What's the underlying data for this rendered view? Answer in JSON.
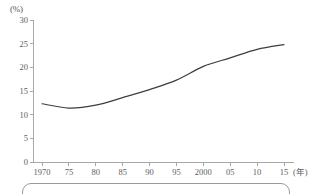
{
  "figure": {
    "background_color": "#ffffff",
    "line_color": "#3d3d3d",
    "axis_color": "#a8a8a8",
    "text_color": "#5d5d5d"
  },
  "axes": {
    "y_unit_label": "(%)",
    "x_unit_label": "(年)"
  },
  "caption_box": {
    "text": ""
  },
  "chart_data": {
    "type": "line",
    "title": "",
    "subtitle": "",
    "xlabel": "(年)",
    "ylabel": "(%)",
    "xlim": [
      1968,
      2017
    ],
    "ylim": [
      0,
      30
    ],
    "grid": false,
    "legend": false,
    "legend_position": "none",
    "x_tick_values": [
      1970,
      1975,
      1980,
      1985,
      1990,
      1995,
      2000,
      2005,
      2010,
      2015
    ],
    "x_tick_labels": [
      "1970",
      "75",
      "80",
      "85",
      "90",
      "95",
      "2000",
      "05",
      "10",
      "15"
    ],
    "y_tick_values": [
      0,
      5,
      10,
      15,
      20,
      25,
      30
    ],
    "y_tick_labels": [
      "0",
      "5",
      "10",
      "15",
      "20",
      "25",
      "30"
    ],
    "series": [
      {
        "name": "",
        "color": "#3d3d3d",
        "x": [
          1970,
          1975,
          1980,
          1985,
          1990,
          1995,
          2000,
          2005,
          2010,
          2015
        ],
        "values": [
          12.3,
          11.4,
          12.0,
          13.6,
          15.3,
          17.3,
          20.2,
          22.0,
          23.8,
          24.8
        ]
      }
    ],
    "annotations": []
  }
}
